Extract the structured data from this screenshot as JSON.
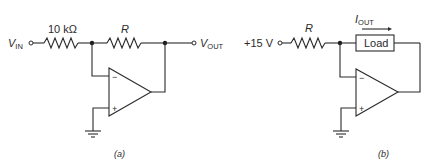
{
  "figure_a": {
    "input_label": "V",
    "input_sub": "IN",
    "input_resistor_label": "10 kΩ",
    "feedback_resistor_label": "R",
    "output_label": "V",
    "output_sub": "OUT",
    "inverting_sign": "−",
    "noninverting_sign": "+",
    "caption": "(a)"
  },
  "figure_b": {
    "source_label": "+15 V",
    "resistor_label": "R",
    "load_label": "Load",
    "current_label": "I",
    "current_sub": "OUT",
    "inverting_sign": "−",
    "noninverting_sign": "+",
    "caption": "(b)"
  },
  "colors": {
    "line": "#2b2b2b",
    "background": "#ffffff"
  }
}
